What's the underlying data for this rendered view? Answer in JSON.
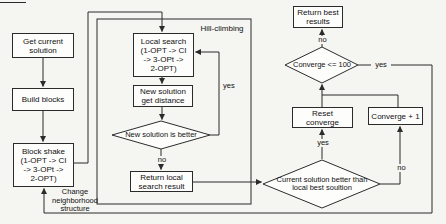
{
  "colors": {
    "background": "#f5f5f2",
    "line": "#2b2b2b",
    "node_fill": "#fdfdfc",
    "text": "#111111"
  },
  "nodes": {
    "get_current": {
      "lines": [
        "Get current",
        "solution"
      ]
    },
    "build_blocks": {
      "lines": [
        "Build blocks"
      ]
    },
    "block_shake": {
      "lines": [
        "Block shake",
        "(1-OPT -> CI",
        "-> 3-OPt ->",
        "2-OPT)"
      ]
    },
    "local_search": {
      "lines": [
        "Local search",
        "(1-OPT -> CI",
        "-> 3-OPt ->",
        "2-OPT)"
      ]
    },
    "new_solution": {
      "lines": [
        "New solution",
        "get distance"
      ]
    },
    "return_local": {
      "lines": [
        "Return local",
        "search result"
      ]
    },
    "return_best": {
      "lines": [
        "Return best",
        "results"
      ]
    },
    "reset_converge": {
      "lines": [
        "Reset",
        "converge"
      ]
    },
    "converge_plus": {
      "lines": [
        "Converge + 1"
      ]
    }
  },
  "decisions": {
    "new_better": {
      "label": "New solution is better"
    },
    "converge_check": {
      "label": "Converge <= 100"
    },
    "current_better": {
      "lines": [
        "Current solution better than",
        "local best soultion"
      ]
    }
  },
  "labels": {
    "hill_climbing": "Hill-climbing",
    "change_structure": [
      "Change",
      "neighborhood",
      "structure"
    ],
    "hill_yes": "yes",
    "better_no": "no",
    "current_yes": "yes",
    "current_no": "no",
    "converge_no": "no",
    "converge_yes": "yes"
  }
}
